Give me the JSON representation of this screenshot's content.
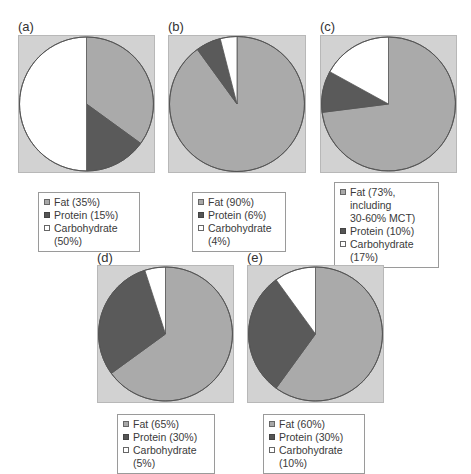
{
  "colors": {
    "fat": "#aaaaaa",
    "protein": "#5a5a5a",
    "carbohydrate": "#ffffff",
    "plot_background": "#d2d2d2",
    "outline": "#555555"
  },
  "chart_data": [
    {
      "type": "pie",
      "panel": "(a)",
      "categories": [
        "Fat",
        "Protein",
        "Carbohydrate"
      ],
      "values": [
        35,
        15,
        50
      ],
      "legend": [
        "Fat (35%)",
        "Protein (15%)",
        "Carbohydrate (50%)"
      ],
      "start_angle": "12 o'clock, clockwise",
      "legend_position": "below"
    },
    {
      "type": "pie",
      "panel": "(b)",
      "categories": [
        "Fat",
        "Protein",
        "Carbohydrate"
      ],
      "values": [
        90,
        6,
        4
      ],
      "legend": [
        "Fat (90%)",
        "Protein (6%)",
        "Carbohydrate (4%)"
      ],
      "start_angle": "12 o'clock, clockwise",
      "legend_position": "below"
    },
    {
      "type": "pie",
      "panel": "(c)",
      "categories": [
        "Fat",
        "Protein",
        "Carbohydrate"
      ],
      "values": [
        73,
        10,
        17
      ],
      "legend": [
        "Fat (73%, including 30-60% MCT)",
        "Protein (10%)",
        "Carbohydrate (17%)"
      ],
      "annotations": [
        "Fat includes 30-60% MCT"
      ],
      "start_angle": "12 o'clock, clockwise",
      "legend_position": "below"
    },
    {
      "type": "pie",
      "panel": "(d)",
      "categories": [
        "Fat",
        "Protein",
        "Carbohydrate"
      ],
      "values": [
        65,
        30,
        5
      ],
      "legend": [
        "Fat (65%)",
        "Protein (30%)",
        "Carbohydrate (5%)"
      ],
      "start_angle": "12 o'clock, clockwise",
      "legend_position": "below"
    },
    {
      "type": "pie",
      "panel": "(e)",
      "categories": [
        "Fat",
        "Protein",
        "Carbohydrate"
      ],
      "values": [
        60,
        30,
        10
      ],
      "legend": [
        "Fat (60%)",
        "Protein (30%)",
        "Carbohydrate (10%)"
      ],
      "start_angle": "12 o'clock, clockwise",
      "legend_position": "below"
    }
  ],
  "panels": [
    {
      "label": "(a)",
      "legend": {
        "fat": "Fat (35%)",
        "protein": "Protein (15%)",
        "carbohydrate": "Carbohydrate (50%)"
      }
    },
    {
      "label": "(b)",
      "legend": {
        "fat": "Fat (90%)",
        "protein": "Protein (6%)",
        "carbohydrate": "Carbohydrate (4%)"
      }
    },
    {
      "label": "(c)",
      "legend": {
        "fat_line1": "Fat (73%, including",
        "fat_line2": "30-60% MCT)",
        "protein": "Protein (10%)",
        "carbohydrate": "Carbohydrate (17%)"
      }
    },
    {
      "label": "(d)",
      "legend": {
        "fat": "Fat (65%)",
        "protein": "Protein (30%)",
        "carbohydrate": "Carbohydrate (5%)"
      }
    },
    {
      "label": "(e)",
      "legend": {
        "fat": "Fat (60%)",
        "protein": "Protein (30%)",
        "carbohydrate": "Carbohydrate (10%)"
      }
    }
  ]
}
